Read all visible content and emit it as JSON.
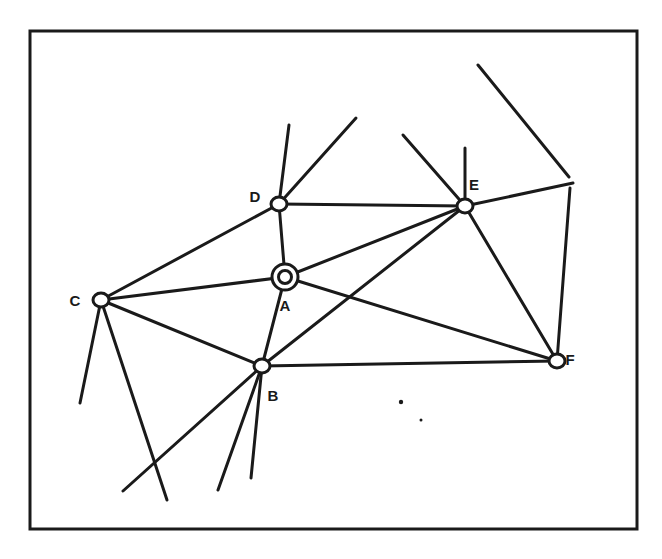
{
  "diagram": {
    "type": "network-graph",
    "frame": {
      "x1": 30,
      "y1": 31,
      "x2": 637,
      "y2": 529,
      "color": "#1a1a1a"
    },
    "stroke_color": "#1a1a1a",
    "nodes": [
      {
        "id": "A",
        "label": "A",
        "x": 285,
        "y": 277,
        "style": "double-circle",
        "label_dx": 0,
        "label_dy": 30
      },
      {
        "id": "B",
        "label": "B",
        "x": 262,
        "y": 366,
        "style": "circle",
        "label_dx": 11,
        "label_dy": 31
      },
      {
        "id": "C",
        "label": "C",
        "x": 101,
        "y": 300,
        "style": "circle",
        "label_dx": -26,
        "label_dy": 2
      },
      {
        "id": "D",
        "label": "D",
        "x": 279,
        "y": 204,
        "style": "circle",
        "label_dx": -24,
        "label_dy": -6
      },
      {
        "id": "E",
        "label": "E",
        "x": 465,
        "y": 206,
        "style": "circle",
        "label_dx": 9,
        "label_dy": -20
      },
      {
        "id": "F",
        "label": "F",
        "x": 557,
        "y": 361,
        "style": "circle",
        "label_dx": 13,
        "label_dy": 0
      }
    ],
    "edges": [
      {
        "from": "D",
        "to": "E"
      },
      {
        "from": "D",
        "to": "A"
      },
      {
        "from": "D",
        "to": "C"
      },
      {
        "from": "C",
        "to": "A"
      },
      {
        "from": "C",
        "to": "B"
      },
      {
        "from": "A",
        "to": "B"
      },
      {
        "from": "A",
        "to": "E"
      },
      {
        "from": "A",
        "to": "F"
      },
      {
        "from": "B",
        "to": "E"
      },
      {
        "from": "B",
        "to": "F"
      },
      {
        "from": "E",
        "to": "F"
      }
    ],
    "rays": [
      {
        "x1": 279,
        "y1": 204,
        "x2": 289,
        "y2": 125
      },
      {
        "x1": 279,
        "y1": 204,
        "x2": 356,
        "y2": 118
      },
      {
        "x1": 465,
        "y1": 206,
        "x2": 403,
        "y2": 135
      },
      {
        "x1": 465,
        "y1": 206,
        "x2": 465,
        "y2": 148
      },
      {
        "x1": 465,
        "y1": 206,
        "x2": 573,
        "y2": 183
      },
      {
        "x1": 478,
        "y1": 65,
        "x2": 569,
        "y2": 177
      },
      {
        "x1": 570,
        "y1": 188,
        "x2": 557,
        "y2": 361
      },
      {
        "x1": 101,
        "y1": 300,
        "x2": 80,
        "y2": 403
      },
      {
        "x1": 101,
        "y1": 300,
        "x2": 167,
        "y2": 500
      },
      {
        "x1": 262,
        "y1": 366,
        "x2": 123,
        "y2": 491
      },
      {
        "x1": 262,
        "y1": 366,
        "x2": 218,
        "y2": 490
      },
      {
        "x1": 262,
        "y1": 366,
        "x2": 251,
        "y2": 478
      }
    ],
    "specks": [
      {
        "x": 401,
        "y": 402,
        "r": 2.2
      },
      {
        "x": 421,
        "y": 420,
        "r": 1.5
      }
    ]
  }
}
